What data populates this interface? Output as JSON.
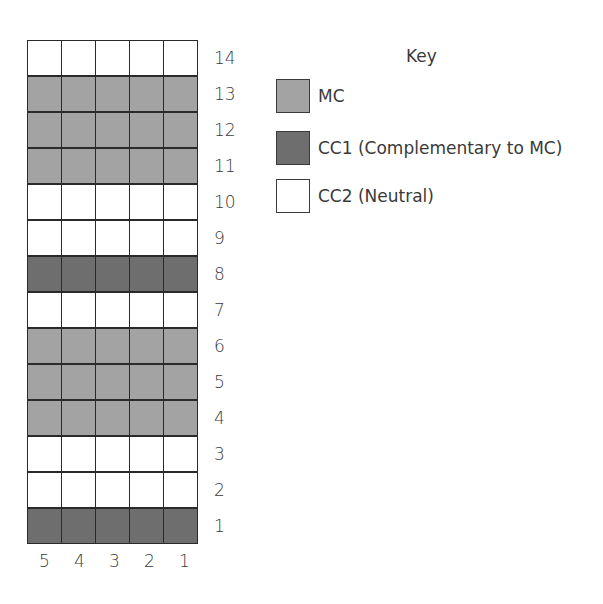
{
  "chart_data": {
    "type": "table",
    "columns": [
      5,
      4,
      3,
      2,
      1
    ],
    "rows_top_to_bottom": [
      14,
      13,
      12,
      11,
      10,
      9,
      8,
      7,
      6,
      5,
      4,
      3,
      2,
      1
    ],
    "row_colors": {
      "1": "CC1",
      "2": "CC2",
      "3": "CC2",
      "4": "MC",
      "5": "MC",
      "6": "MC",
      "7": "CC2",
      "8": "CC1",
      "9": "CC2",
      "10": "CC2",
      "11": "MC",
      "12": "MC",
      "13": "MC",
      "14": "CC2"
    },
    "grid": true
  },
  "colors": {
    "MC": "#a3a3a3",
    "CC1": "#6e6e6e",
    "CC2": "#ffffff"
  },
  "key": {
    "title": "Key",
    "items": [
      {
        "code": "MC",
        "label": "MC"
      },
      {
        "code": "CC1",
        "label": "CC1 (Complementary to MC)"
      },
      {
        "code": "CC2",
        "label": "CC2 (Neutral)"
      }
    ]
  }
}
